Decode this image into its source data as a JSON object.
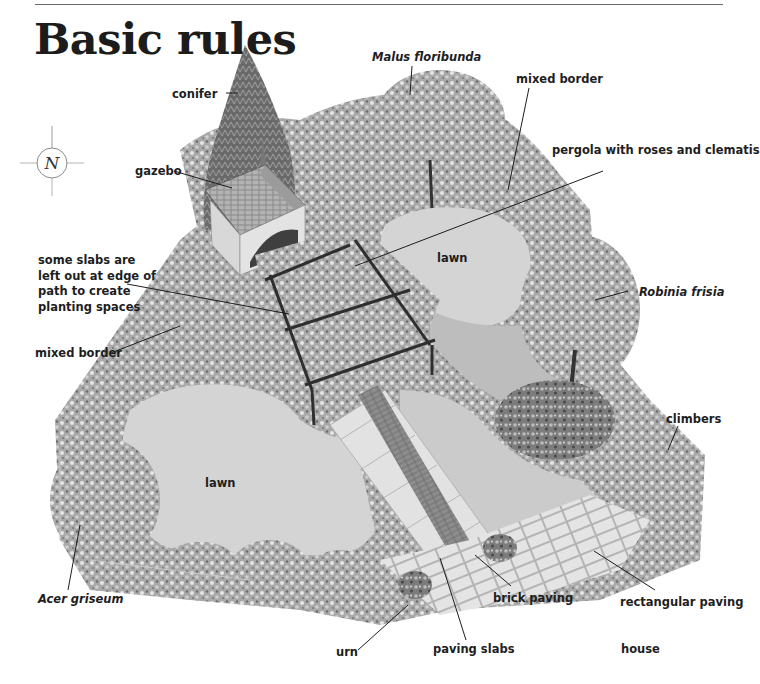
{
  "page": {
    "title": "Basic rules"
  },
  "compass": {
    "letter": "N",
    "icon": "compass-north-icon"
  },
  "illustration": {
    "subject": "isometric garden plan",
    "colors": {
      "background": "#ffffff",
      "lawn": "#d4d4d4",
      "foliage_light": "#bdbdbd",
      "foliage_dark": "#5e5e5e",
      "paving": "#e2e2e2",
      "brick": "#6d6d6d",
      "text": "#1e1e1e"
    }
  },
  "labels": [
    {
      "id": "conifer",
      "text": "conifer",
      "italic": false
    },
    {
      "id": "malus",
      "text": "Malus floribunda",
      "italic": true
    },
    {
      "id": "mixed-border-top",
      "text": "mixed border",
      "italic": false
    },
    {
      "id": "gazebo",
      "text": "gazebo",
      "italic": false
    },
    {
      "id": "pergola",
      "text": "pergola with roses and clematis",
      "italic": false
    },
    {
      "id": "slabs",
      "text": "some slabs are\nleft out at edge of\npath to create\nplanting spaces",
      "italic": false
    },
    {
      "id": "lawn-top",
      "text": "lawn",
      "italic": false
    },
    {
      "id": "robinia",
      "text": "Robinia frisia",
      "italic": true
    },
    {
      "id": "mixed-border-left",
      "text": "mixed border",
      "italic": false
    },
    {
      "id": "climbers",
      "text": "climbers",
      "italic": false
    },
    {
      "id": "lawn-bottom",
      "text": "lawn",
      "italic": false
    },
    {
      "id": "acer",
      "text": "Acer griseum",
      "italic": true
    },
    {
      "id": "brick-paving",
      "text": "brick paving",
      "italic": false
    },
    {
      "id": "rectangular-paving",
      "text": "rectangular paving",
      "italic": false
    },
    {
      "id": "urn",
      "text": "urn",
      "italic": false
    },
    {
      "id": "paving-slabs",
      "text": "paving slabs",
      "italic": false
    },
    {
      "id": "house",
      "text": "house",
      "italic": false
    }
  ]
}
